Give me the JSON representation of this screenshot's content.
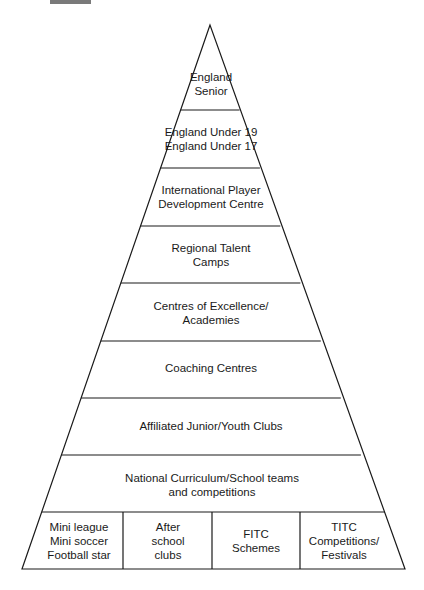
{
  "diagram": {
    "type": "pyramid",
    "tiers": [
      {
        "lines": [
          "England",
          "Senior"
        ]
      },
      {
        "lines": [
          "England Under 19",
          "England Under 17"
        ]
      },
      {
        "lines": [
          "International Player",
          "Development Centre"
        ]
      },
      {
        "lines": [
          "Regional Talent",
          "Camps"
        ]
      },
      {
        "lines": [
          "Centres of Excellence/",
          "Academies"
        ]
      },
      {
        "lines": [
          "Coaching Centres"
        ]
      },
      {
        "lines": [
          "Affiliated Junior/Youth Clubs"
        ]
      },
      {
        "lines": [
          "National Curriculum/School teams",
          "and competitions"
        ]
      }
    ],
    "base_cells": [
      {
        "lines": [
          "Mini league",
          "Mini soccer",
          "Football star"
        ]
      },
      {
        "lines": [
          "After",
          "school",
          "clubs"
        ]
      },
      {
        "lines": [
          "FITC",
          "Schemes"
        ]
      },
      {
        "lines": [
          "TITC",
          "Competitions/",
          "Festivals"
        ]
      }
    ],
    "colors": {
      "stroke": "#1a1a1a",
      "background": "#ffffff",
      "corner_bar": "#7a7a7a"
    }
  }
}
